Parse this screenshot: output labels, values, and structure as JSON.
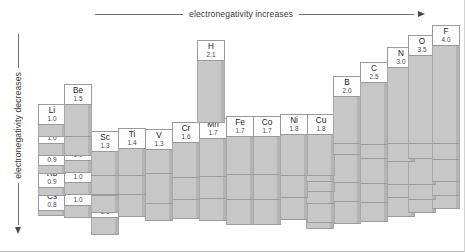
{
  "axes": {
    "top_label": "electronegativity increases",
    "left_label": "electronegativity decreases"
  },
  "chart_data": {
    "type": "bar",
    "subtitle": "Periodic table rendered as a 3-D bar chart; bar height is proportional to electronegativity",
    "xlabel": "electronegativity increases",
    "ylabel": "electronegativity decreases",
    "value_label": "Pauling electronegativity",
    "value_range": [
      0.7,
      4.0
    ],
    "grid": false,
    "legend": false,
    "categories": [
      "H",
      "Li",
      "Be",
      "B",
      "C",
      "N",
      "O",
      "F",
      "Na",
      "Mg",
      "Al",
      "Si",
      "P",
      "S",
      "Cl",
      "K",
      "Ca",
      "Sc",
      "Ti",
      "V",
      "Cr",
      "Mn",
      "Fe",
      "Co",
      "Ni",
      "Cu",
      "Zn",
      "Ga",
      "Ge",
      "As",
      "Se",
      "Br",
      "Rb",
      "Sr",
      "Y",
      "Zr",
      "Nb",
      "Mo",
      "Tc",
      "Ru",
      "Rh",
      "Pd",
      "Ag",
      "Cd",
      "In",
      "Sn",
      "Sb",
      "Te",
      "I",
      "Cs",
      "Ba",
      "La",
      "Hf",
      "Ta",
      "W",
      "Re",
      "Os",
      "Ir",
      "Pt",
      "Au",
      "Hg",
      "Tl",
      "Pb",
      "Bi",
      "Po",
      "At",
      "Fr",
      "Ra",
      "Ac"
    ],
    "values": [
      2.1,
      1.0,
      1.5,
      2.0,
      2.5,
      3.0,
      3.5,
      4.0,
      1.0,
      1.2,
      1.5,
      1.8,
      2.1,
      2.5,
      3.0,
      0.8,
      1.0,
      1.3,
      1.4,
      1.3,
      1.6,
      1.7,
      1.7,
      1.7,
      1.8,
      1.8,
      1.6,
      1.7,
      1.9,
      2.1,
      2.4,
      2.8,
      0.8,
      1.0,
      1.2,
      1.3,
      1.5,
      1.6,
      1.7,
      1.8,
      1.8,
      1.8,
      1.6,
      1.6,
      1.6,
      1.8,
      1.9,
      2.1,
      2.5,
      0.8,
      1.0,
      1.1,
      1.3,
      1.4,
      1.5,
      1.7,
      1.9,
      1.9,
      1.8,
      1.9,
      1.7,
      1.6,
      1.7,
      1.8,
      1.9,
      2.1,
      0.8,
      1.0,
      1.1
    ]
  },
  "elements": [
    {
      "sym": "H",
      "val": "2.1",
      "x": 197,
      "y": 40,
      "w": 28,
      "h": 21,
      "depth": 62
    },
    {
      "sym": "Li",
      "x": 38,
      "y": 104,
      "w": 28,
      "h": 21,
      "val": "1.0",
      "depth": 12
    },
    {
      "sym": "Be",
      "x": 64,
      "y": 84,
      "w": 28,
      "h": 21,
      "val": "1.5",
      "depth": 32
    },
    {
      "sym": "Na",
      "x": 38,
      "y": 123,
      "w": 28,
      "h": 21,
      "val": "1.0",
      "depth": 12
    },
    {
      "sym": "Mg",
      "x": 64,
      "y": 114,
      "w": 28,
      "h": 21,
      "val": "1.2",
      "depth": 21
    },
    {
      "sym": "K",
      "x": 38,
      "y": 145,
      "w": 28,
      "h": 21,
      "val": "0.9",
      "depth": 8
    },
    {
      "sym": "Ca",
      "x": 64,
      "y": 140,
      "w": 28,
      "h": 21,
      "val": "1.0",
      "depth": 12
    },
    {
      "sym": "Rb",
      "x": 38,
      "y": 167,
      "w": 28,
      "h": 21,
      "val": "0.9",
      "depth": 8
    },
    {
      "sym": "Sr",
      "x": 64,
      "y": 162,
      "w": 28,
      "h": 21,
      "val": "1.0",
      "depth": 12
    },
    {
      "sym": "Cs",
      "x": 38,
      "y": 190,
      "w": 28,
      "h": 21,
      "val": "0.8",
      "depth": 5
    },
    {
      "sym": "Ba",
      "x": 64,
      "y": 185,
      "w": 28,
      "h": 21,
      "val": "1.0",
      "depth": 12
    },
    {
      "sym": "Fr",
      "x": 38,
      "y": 211,
      "w": 28,
      "h": 21,
      "val": "0.8",
      "depth": 5
    },
    {
      "sym": "Ra",
      "x": 64,
      "y": 207,
      "w": 28,
      "h": 21,
      "val": "1.0",
      "depth": 12
    },
    {
      "sym": "Sc",
      "x": 91,
      "y": 131,
      "w": 28,
      "h": 21,
      "val": "1.3",
      "depth": 24
    },
    {
      "sym": "Y",
      "x": 91,
      "y": 153,
      "w": 28,
      "h": 21,
      "val": "1.2",
      "depth": 21
    },
    {
      "sym": "La",
      "x": 91,
      "y": 175,
      "w": 28,
      "h": 21,
      "val": "1.1",
      "depth": 17
    },
    {
      "sym": "Ac",
      "x": 91,
      "y": 197,
      "w": 28,
      "h": 21,
      "val": "1.1",
      "depth": 17
    },
    {
      "sym": "Ti",
      "x": 118,
      "y": 128,
      "w": 28,
      "h": 21,
      "val": "1.4",
      "depth": 27
    },
    {
      "sym": "Zr",
      "x": 118,
      "y": 150,
      "w": 28,
      "h": 21,
      "val": "1.3",
      "depth": 24
    },
    {
      "sym": "Hf",
      "x": 118,
      "y": 172,
      "w": 28,
      "h": 21,
      "val": "1.3",
      "depth": 24
    },
    {
      "sym": "V",
      "x": 145,
      "y": 129,
      "w": 28,
      "h": 21,
      "val": "1.3",
      "depth": 24
    },
    {
      "sym": "Nb",
      "x": 145,
      "y": 151,
      "w": 28,
      "h": 21,
      "val": "1.5",
      "depth": 32
    },
    {
      "sym": "Ta",
      "x": 145,
      "y": 173,
      "w": 28,
      "h": 21,
      "val": "1.4",
      "depth": 27
    },
    {
      "sym": "Cr",
      "x": 172,
      "y": 122,
      "w": 28,
      "h": 21,
      "val": "1.6",
      "depth": 35
    },
    {
      "sym": "Mo",
      "x": 172,
      "y": 144,
      "w": 28,
      "h": 21,
      "val": "1.6",
      "depth": 35
    },
    {
      "sym": "W",
      "x": 172,
      "y": 166,
      "w": 28,
      "h": 21,
      "val": "1.5",
      "depth": 32
    },
    {
      "sym": "Mn",
      "x": 199,
      "y": 118,
      "w": 28,
      "h": 21,
      "val": "1.7",
      "depth": 38
    },
    {
      "sym": "Tc",
      "x": 199,
      "y": 140,
      "w": 28,
      "h": 21,
      "val": "1.7",
      "depth": 38
    },
    {
      "sym": "Re",
      "x": 199,
      "y": 162,
      "w": 28,
      "h": 21,
      "val": "1.7",
      "depth": 38
    },
    {
      "sym": "Fe",
      "x": 226,
      "y": 116,
      "w": 28,
      "h": 21,
      "val": "1.7",
      "depth": 38
    },
    {
      "sym": "Ru",
      "x": 226,
      "y": 138,
      "w": 28,
      "h": 21,
      "val": "1.8",
      "depth": 41
    },
    {
      "sym": "Os",
      "x": 226,
      "y": 160,
      "w": 28,
      "h": 21,
      "val": "1.9",
      "depth": 44
    },
    {
      "sym": "Co",
      "x": 253,
      "y": 116,
      "w": 28,
      "h": 21,
      "val": "1.7",
      "depth": 38
    },
    {
      "sym": "Rh",
      "x": 253,
      "y": 138,
      "w": 28,
      "h": 21,
      "val": "1.8",
      "depth": 41
    },
    {
      "sym": "Ir",
      "x": 253,
      "y": 160,
      "w": 28,
      "h": 21,
      "val": "1.9",
      "depth": 44
    },
    {
      "sym": "Ni",
      "x": 280,
      "y": 114,
      "w": 28,
      "h": 21,
      "val": "1.8",
      "depth": 41
    },
    {
      "sym": "Pd",
      "x": 280,
      "y": 136,
      "w": 28,
      "h": 21,
      "val": "1.8",
      "depth": 41
    },
    {
      "sym": "Pt",
      "x": 280,
      "y": 158,
      "w": 28,
      "h": 21,
      "val": "1.8",
      "depth": 41
    },
    {
      "sym": "Cu",
      "x": 307,
      "y": 114,
      "w": 28,
      "h": 21,
      "val": "1.8",
      "depth": 41
    },
    {
      "sym": "Ag",
      "x": 307,
      "y": 136,
      "w": 28,
      "h": 21,
      "val": "1.6",
      "depth": 35
    },
    {
      "sym": "Au",
      "x": 307,
      "y": 158,
      "w": 28,
      "h": 21,
      "val": "1.9",
      "depth": 44
    },
    {
      "sym": "Zn",
      "x": 306,
      "y": 126,
      "w": 28,
      "h": 21,
      "val": "1.6",
      "depth": 35
    },
    {
      "sym": "Cd",
      "x": 306,
      "y": 148,
      "w": 28,
      "h": 21,
      "val": "1.6",
      "depth": 35
    },
    {
      "sym": "Hg",
      "x": 306,
      "y": 170,
      "w": 28,
      "h": 21,
      "val": "1.7",
      "depth": 38
    },
    {
      "sym": "Ga",
      "x": 333,
      "y": 124,
      "w": 28,
      "h": 21,
      "val": "1.7",
      "depth": 38
    },
    {
      "sym": "In",
      "x": 333,
      "y": 146,
      "w": 28,
      "h": 21,
      "val": "1.6",
      "depth": 35
    },
    {
      "sym": "Tl",
      "x": 333,
      "y": 168,
      "w": 28,
      "h": 21,
      "val": "1.6",
      "depth": 35
    },
    {
      "sym": "Al",
      "x": 333,
      "y": 102,
      "w": 28,
      "h": 21,
      "val": "1.5",
      "depth": 32
    },
    {
      "sym": "B",
      "x": 333,
      "y": 76,
      "w": 28,
      "h": 21,
      "val": "2.0",
      "depth": 47
    },
    {
      "sym": "Ge",
      "x": 360,
      "y": 119,
      "w": 28,
      "h": 21,
      "val": "1.9",
      "depth": 44
    },
    {
      "sym": "Sn",
      "x": 360,
      "y": 141,
      "w": 28,
      "h": 21,
      "val": "1.8",
      "depth": 41
    },
    {
      "sym": "Pb",
      "x": 360,
      "y": 163,
      "w": 28,
      "h": 21,
      "val": "1.7",
      "depth": 38
    },
    {
      "sym": "Si",
      "x": 360,
      "y": 97,
      "w": 28,
      "h": 21,
      "val": "1.8",
      "depth": 41
    },
    {
      "sym": "C",
      "x": 360,
      "y": 62,
      "w": 28,
      "h": 21,
      "val": "2.5",
      "depth": 62
    },
    {
      "sym": "As",
      "x": 387,
      "y": 111,
      "w": 28,
      "h": 21,
      "val": "2.1",
      "depth": 53
    },
    {
      "sym": "Sb",
      "x": 387,
      "y": 133,
      "w": 28,
      "h": 21,
      "val": "1.9",
      "depth": 44
    },
    {
      "sym": "Bi",
      "x": 387,
      "y": 155,
      "w": 28,
      "h": 21,
      "val": "1.8",
      "depth": 41
    },
    {
      "sym": "P",
      "x": 387,
      "y": 88,
      "w": 28,
      "h": 21,
      "val": "2.1",
      "depth": 53
    },
    {
      "sym": "N",
      "x": 387,
      "y": 47,
      "w": 28,
      "h": 21,
      "val": "3.0",
      "depth": 76
    },
    {
      "sym": "Se",
      "x": 408,
      "y": 104,
      "w": 28,
      "h": 21,
      "val": "2.4",
      "depth": 60
    },
    {
      "sym": "Te",
      "x": 408,
      "y": 126,
      "w": 28,
      "h": 21,
      "val": "2.1",
      "depth": 53
    },
    {
      "sym": "Po",
      "x": 408,
      "y": 148,
      "w": 28,
      "h": 21,
      "val": "1.9",
      "depth": 44
    },
    {
      "sym": "S",
      "x": 408,
      "y": 76,
      "w": 28,
      "h": 21,
      "val": "2.5",
      "depth": 62
    },
    {
      "sym": "O",
      "x": 408,
      "y": 35,
      "w": 28,
      "h": 21,
      "val": "3.5",
      "depth": 88
    },
    {
      "sym": "Br",
      "x": 432,
      "y": 91,
      "w": 28,
      "h": 21,
      "val": "2.8",
      "depth": 70
    },
    {
      "sym": "I",
      "x": 432,
      "y": 113,
      "w": 28,
      "h": 21,
      "val": "2.5",
      "depth": 62
    },
    {
      "sym": "At",
      "x": 432,
      "y": 135,
      "w": 28,
      "h": 21,
      "val": "2.1",
      "depth": 53
    },
    {
      "sym": "Cl",
      "x": 432,
      "y": 63,
      "w": 28,
      "h": 21,
      "val": "3.0",
      "depth": 76
    },
    {
      "sym": "F",
      "x": 432,
      "y": 25,
      "w": 28,
      "h": 21,
      "val": "4.0",
      "depth": 98
    }
  ]
}
